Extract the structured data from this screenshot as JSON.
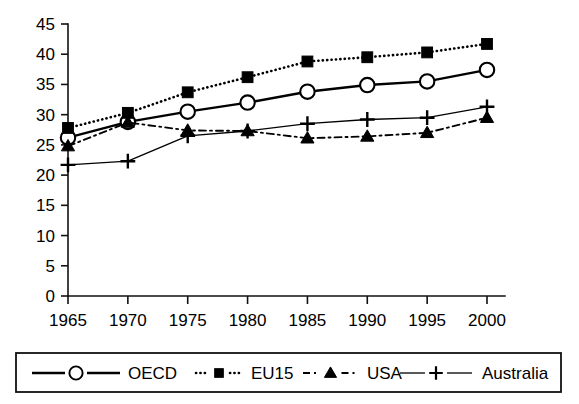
{
  "chart_data": {
    "type": "line",
    "title": "",
    "subtitle": "",
    "xlabel": "",
    "ylabel": "",
    "x": [
      1965,
      1970,
      1975,
      1980,
      1985,
      1990,
      1995,
      2000
    ],
    "categories": [
      "1965",
      "1970",
      "1975",
      "1980",
      "1985",
      "1990",
      "1995",
      "2000"
    ],
    "xlim": [
      1962.5,
      2002.5
    ],
    "ylim": [
      0,
      45
    ],
    "yticks": [
      0,
      5,
      10,
      15,
      20,
      25,
      30,
      35,
      40,
      45
    ],
    "ytick_labels": [
      "0",
      "5",
      "10",
      "15",
      "20",
      "25",
      "30",
      "35",
      "40",
      "45"
    ],
    "xtick_labels": [
      "1965",
      "1970",
      "1975",
      "1980",
      "1985",
      "1990",
      "1995",
      "2000"
    ],
    "grid": false,
    "legend_position": "bottom",
    "series": [
      {
        "name": "OECD",
        "marker": "circle-open",
        "linestyle": "solid",
        "color": "#000000",
        "values": [
          26.2,
          28.8,
          30.5,
          32.0,
          33.8,
          34.9,
          35.5,
          37.4
        ]
      },
      {
        "name": "EU15",
        "marker": "square-filled",
        "linestyle": "dotted",
        "color": "#000000",
        "values": [
          27.8,
          30.3,
          33.7,
          36.2,
          38.8,
          39.5,
          40.3,
          41.7
        ]
      },
      {
        "name": "USA",
        "marker": "triangle-filled",
        "linestyle": "dashdot",
        "color": "#000000",
        "values": [
          24.8,
          28.7,
          27.4,
          27.3,
          26.1,
          26.4,
          27.0,
          29.5
        ]
      },
      {
        "name": "Australia",
        "marker": "plus",
        "linestyle": "solid-thin",
        "color": "#000000",
        "values": [
          21.7,
          22.3,
          26.5,
          27.3,
          28.5,
          29.2,
          29.5,
          31.3
        ]
      }
    ]
  },
  "legend": {
    "entries": [
      {
        "label": "OECD",
        "marker": "circle-open",
        "linestyle": "solid"
      },
      {
        "label": "EU15",
        "marker": "square-filled",
        "linestyle": "dotted"
      },
      {
        "label": "USA",
        "marker": "triangle-filled",
        "linestyle": "dashdot"
      },
      {
        "label": "Australia",
        "marker": "plus",
        "linestyle": "solid-thin"
      }
    ]
  }
}
